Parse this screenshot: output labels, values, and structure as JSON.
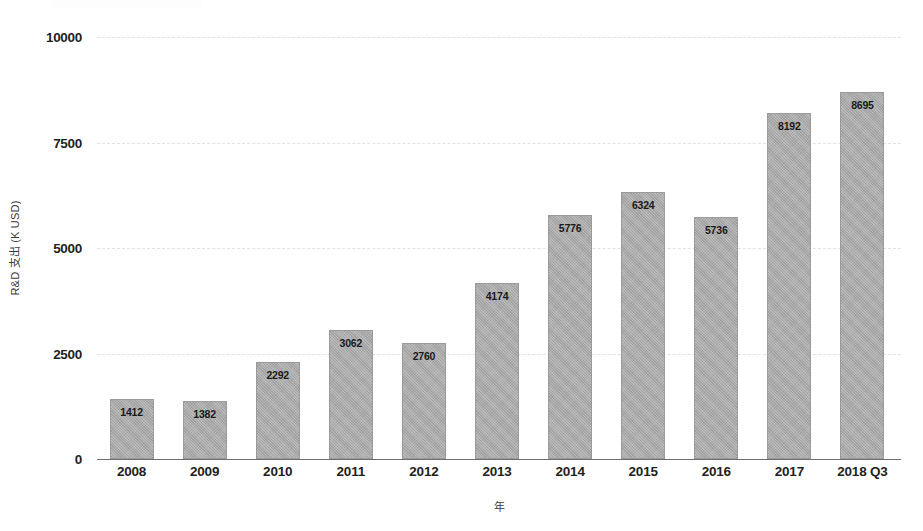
{
  "chart_data": {
    "type": "bar",
    "title": "",
    "xlabel": "年",
    "ylabel": "R&D 支出 (K USD)",
    "categories": [
      "2008",
      "2009",
      "2010",
      "2011",
      "2012",
      "2013",
      "2014",
      "2015",
      "2016",
      "2017",
      "2018 Q3"
    ],
    "values": [
      1412,
      1382,
      2292,
      3062,
      2760,
      4174,
      5776,
      6324,
      5736,
      8192,
      8695
    ],
    "value_labels": [
      "1412",
      "1382",
      "2292",
      "3062",
      "2760",
      "4174",
      "5776",
      "6324",
      "5736",
      "8192",
      "8695"
    ],
    "ylim": [
      0,
      10000
    ],
    "yticks": [
      0,
      2500,
      5000,
      7500,
      10000
    ],
    "ytick_labels": [
      "0",
      "2500",
      "5000",
      "7500",
      "10000"
    ],
    "grid": true,
    "legend": "none",
    "colors": {
      "bar_fill": "#a8a8a8",
      "bar_edge": "#9a9a9a",
      "gridline": "#e2e2e4",
      "axis": "#6f6f6f",
      "text": "#231f20"
    }
  }
}
